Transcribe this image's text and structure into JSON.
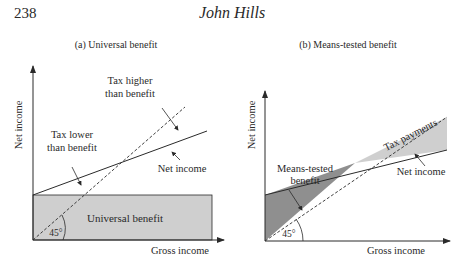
{
  "header": {
    "page_number": "238",
    "running_head": "John Hills"
  },
  "panels": [
    {
      "title": "(a) Universal benefit",
      "y_axis_label": "Net income",
      "x_axis_label": "Gross income",
      "angle_label": "45°",
      "shaded_region_label": "Universal benefit",
      "annotations": [
        {
          "line1": "Tax higher",
          "line2": "than benefit"
        },
        {
          "line1": "Tax lower",
          "line2": "than benefit"
        },
        {
          "line1": "Net income",
          "line2": ""
        }
      ]
    },
    {
      "title": "(b) Means-tested benefit",
      "y_axis_label": "Net income",
      "x_axis_label": "Gross income",
      "angle_label": "45°",
      "annotations": [
        {
          "line1": "Means-tested",
          "line2": "benefit"
        },
        {
          "line1": "Tax payments",
          "line2": ""
        },
        {
          "line1": "Net income",
          "line2": ""
        }
      ]
    }
  ],
  "colors": {
    "shade_light": "#cfcfcf",
    "shade_dark": "#8f8f8f",
    "ink": "#2a2a2a"
  }
}
